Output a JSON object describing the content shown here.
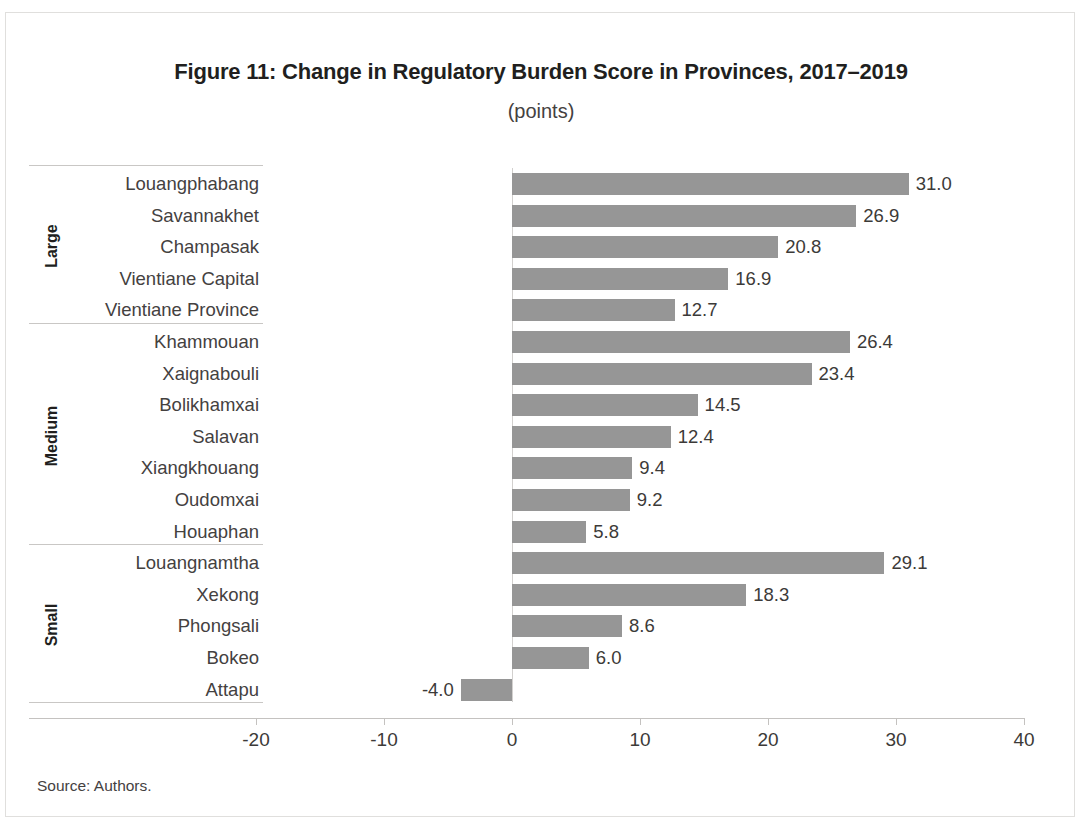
{
  "figure": {
    "title": "Figure 11: Change in Regulatory Burden Score in Provinces, 2017–2019",
    "subtitle": "(points)",
    "source": "Source: Authors."
  },
  "colors": {
    "bar": "#969696",
    "text": "#3c3a38",
    "title": "#211f1e",
    "axis": "#c4c2c0",
    "separator": "#c9c7c5",
    "frame": "#e0dfdd"
  },
  "chart_data": {
    "type": "bar",
    "orientation": "horizontal",
    "title": "Figure 11: Change in Regulatory Burden Score in Provinces, 2017–2019",
    "subtitle": "(points)",
    "xlabel": "",
    "ylabel": "",
    "xlim": [
      -25,
      40
    ],
    "xticks": [
      -20,
      -10,
      0,
      10,
      20,
      30,
      40
    ],
    "xtick_labels": [
      "-20",
      "-10",
      "0",
      "10",
      "20",
      "30",
      "40"
    ],
    "grid": false,
    "legend": "none",
    "groups": [
      {
        "name": "Large",
        "categories": [
          "Louangphabang",
          "Savannakhet",
          "Champasak",
          "Vientiane Capital",
          "Vientiane Province"
        ],
        "values": [
          31.0,
          26.9,
          20.8,
          16.9,
          12.7
        ],
        "labels": [
          "31.0",
          "26.9",
          "20.8",
          "16.9",
          "12.7"
        ]
      },
      {
        "name": "Medium",
        "categories": [
          "Khammouan",
          "Xaignabouli",
          "Bolikhamxai",
          "Salavan",
          "Xiangkhouang",
          "Oudomxai",
          "Houaphan"
        ],
        "values": [
          26.4,
          23.4,
          14.5,
          12.4,
          9.4,
          9.2,
          5.8
        ],
        "labels": [
          "26.4",
          "23.4",
          "14.5",
          "12.4",
          "9.4",
          "9.2",
          "5.8"
        ]
      },
      {
        "name": "Small",
        "categories": [
          "Louangnamtha",
          "Xekong",
          "Phongsali",
          "Bokeo",
          "Attapu"
        ],
        "values": [
          29.1,
          18.3,
          8.6,
          6.0,
          -4.0
        ],
        "labels": [
          "29.1",
          "18.3",
          "8.6",
          "6.0",
          "-4.0"
        ]
      }
    ]
  }
}
